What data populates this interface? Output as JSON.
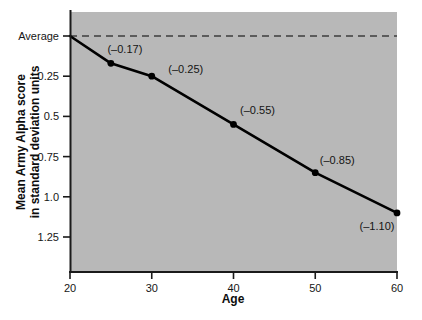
{
  "chart_data": {
    "type": "line",
    "title": "",
    "subtitle": "",
    "xlabel": "Age",
    "ylabel_line1": "Mean Army Alpha score",
    "ylabel_line2": "in standard deviation units",
    "x": [
      20,
      25,
      30,
      40,
      50,
      60
    ],
    "values": [
      0.0,
      -0.17,
      -0.25,
      -0.55,
      -0.85,
      -1.1
    ],
    "point_labels": [
      "",
      "(–0.17)",
      "(–0.25)",
      "(–0.55)",
      "(–0.85)",
      "(–1.10)"
    ],
    "xticks": [
      "20",
      "30",
      "40",
      "50",
      "60"
    ],
    "xtick_values": [
      20,
      30,
      40,
      50,
      60
    ],
    "yticks": [
      "Average",
      "0.25",
      "0.5",
      "0.75",
      "1.0",
      "1.25"
    ],
    "ytick_values": [
      0.0,
      -0.25,
      -0.5,
      -0.75,
      -1.0,
      -1.25
    ],
    "xlim": [
      20,
      60
    ],
    "ylim": [
      -1.4,
      0.075
    ],
    "grid": false,
    "legend": null,
    "reference_line": {
      "label": "Average",
      "value": 0.0,
      "style": "dashed"
    },
    "colors": {
      "plot_background": "#b8b8b8",
      "figure_background": "#ffffff",
      "line": "#000000",
      "marker": "#000000",
      "axis": "#1a1a1a",
      "reference_line": "#3c3c3c",
      "text": "#111111"
    }
  }
}
